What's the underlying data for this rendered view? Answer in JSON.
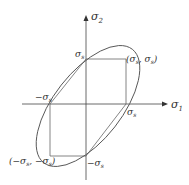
{
  "diagram": {
    "axes": {
      "x_label": "σ",
      "x_sub": "1",
      "y_label": "σ",
      "y_sub": "2"
    },
    "points": {
      "top": {
        "label": "σ",
        "sub": "s"
      },
      "top_right": {
        "open": "(σ",
        "sub1": "s",
        "mid": ", σ",
        "sub2": "s",
        "close": ")"
      },
      "right": {
        "label": "σ",
        "sub": "s"
      },
      "left": {
        "label": "−σ",
        "sub": "s"
      },
      "bottom": {
        "label": "−σ",
        "sub": "s"
      },
      "bottom_left": {
        "open": "(−σ",
        "sub1": "s",
        "mid": ", −σ",
        "sub2": "s",
        "close": ")"
      }
    },
    "curves": [
      "ellipse (von Mises)",
      "hexagon (Tresca)"
    ],
    "colors": {
      "line": "#555555",
      "axis": "#444444"
    }
  }
}
